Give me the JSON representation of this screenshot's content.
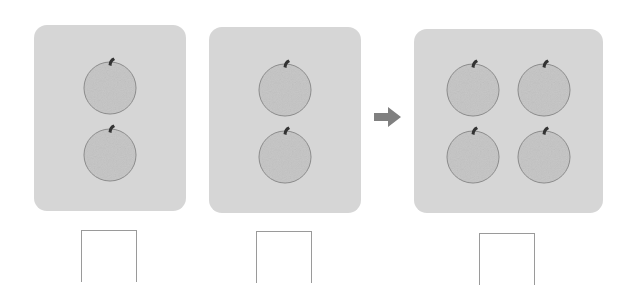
{
  "colors": {
    "panel": "#d6d6d6",
    "apple_fill": "#c4c4c4",
    "apple_outline": "#8a8a8a",
    "stem": "#333333",
    "arrow": "#808080",
    "box_border": "#9a9a9a"
  },
  "panels": [
    {
      "id": "group-1",
      "apple_count": 2,
      "answer": ""
    },
    {
      "id": "group-2",
      "apple_count": 2,
      "answer": ""
    },
    {
      "id": "total",
      "apple_count": 4,
      "answer": ""
    }
  ],
  "arrow": {
    "icon": "right-arrow-icon"
  }
}
